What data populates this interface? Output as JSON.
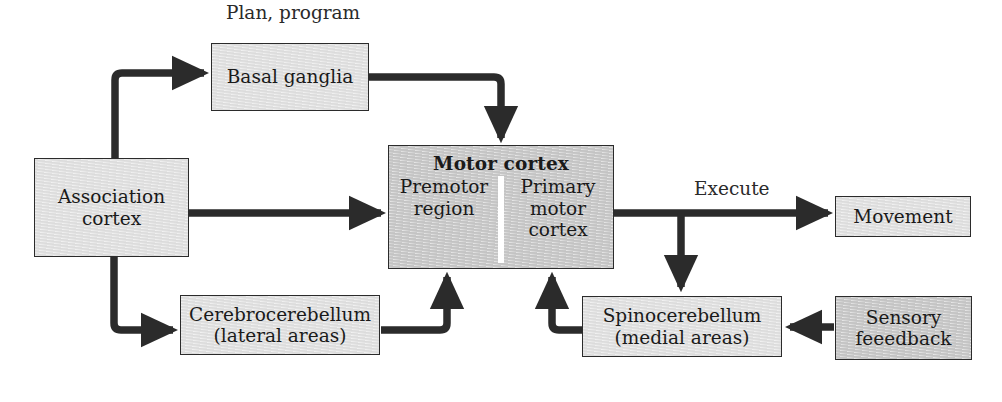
{
  "diagram": {
    "stroke_color": "#2b2b2b",
    "fill_light": "#e2e2e2",
    "fill_medium": "#c9c9c9",
    "divider_color": "#ffffff"
  },
  "labels": {
    "plan_program": "Plan, program",
    "execute": "Execute"
  },
  "nodes": {
    "basal_ganglia": {
      "label": "Basal ganglia",
      "fill": "light"
    },
    "association_cortex": {
      "line1": "Association",
      "line2": "cortex",
      "fill": "light"
    },
    "motor_cortex": {
      "title": "Motor cortex",
      "left_region": "Premotor region",
      "left_region_line1": "Premotor",
      "left_region_line2": "region",
      "right_region": "Primary motor cortex",
      "right_region_line1": "Primary",
      "right_region_line2": "motor",
      "right_region_line3": "cortex",
      "fill": "medium"
    },
    "cerebrocerebellum": {
      "line1": "Cerebrocerebellum",
      "line2": "(lateral areas)",
      "fill": "light"
    },
    "spinocerebellum": {
      "line1": "Spinocerebellum",
      "line2": "(medial areas)",
      "fill": "light"
    },
    "movement": {
      "label": "Movement",
      "fill": "light"
    },
    "sensory_feedback": {
      "line1": "Sensory",
      "line2": "feeedback",
      "fill": "medium"
    }
  },
  "connections": [
    {
      "name": "association-cortex-to-basal-ganglia",
      "from": "association_cortex",
      "to": "basal_ganglia"
    },
    {
      "name": "basal-ganglia-to-motor-cortex",
      "from": "basal_ganglia",
      "to": "motor_cortex"
    },
    {
      "name": "association-cortex-to-motor-cortex",
      "from": "association_cortex",
      "to": "motor_cortex"
    },
    {
      "name": "association-cortex-to-cerebrocerebellum",
      "from": "association_cortex",
      "to": "cerebrocerebellum"
    },
    {
      "name": "cerebrocerebellum-to-motor-cortex",
      "from": "cerebrocerebellum",
      "to": "motor_cortex"
    },
    {
      "name": "motor-cortex-to-movement",
      "from": "motor_cortex",
      "to": "movement",
      "label": "Execute"
    },
    {
      "name": "motor-cortex-to-spinocerebellum",
      "from": "motor_cortex",
      "to": "spinocerebellum"
    },
    {
      "name": "spinocerebellum-to-motor-cortex",
      "from": "spinocerebellum",
      "to": "motor_cortex"
    },
    {
      "name": "sensory-feedback-to-spinocerebellum",
      "from": "sensory_feedback",
      "to": "spinocerebellum"
    }
  ]
}
